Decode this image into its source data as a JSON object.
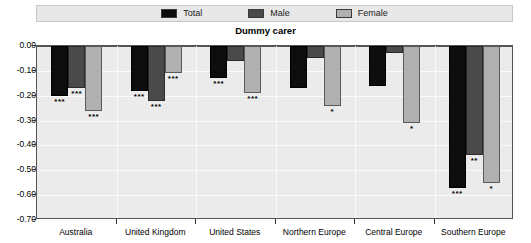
{
  "chart_data": {
    "type": "bar",
    "title": "Dummy carer",
    "subtitle": "",
    "xlabel": "",
    "ylabel": "",
    "ylim": [
      -0.7,
      0.0
    ],
    "ytick_labels": [
      "0.00",
      "-0.10",
      "-0.20",
      "-0.30",
      "-0.40",
      "-0.50",
      "-0.60",
      "-0.70"
    ],
    "ytick_values": [
      0.0,
      -0.1,
      -0.2,
      -0.3,
      -0.4,
      -0.5,
      -0.6,
      -0.7
    ],
    "grid": true,
    "legend_position": "top",
    "categories": [
      "Australia",
      "United Kingdom",
      "United States",
      "Northern Europe",
      "Central Europe",
      "Southern Europe"
    ],
    "series": [
      {
        "name": "Total",
        "color": "#0d0d0d",
        "values": [
          -0.2,
          -0.18,
          -0.13,
          -0.17,
          -0.16,
          -0.57
        ],
        "significance": [
          "***",
          "***",
          "***",
          "",
          "",
          "***"
        ]
      },
      {
        "name": "Male",
        "color": "#4a4a4a",
        "values": [
          -0.17,
          -0.22,
          -0.06,
          -0.05,
          -0.03,
          -0.44
        ],
        "significance": [
          "***",
          "***",
          "",
          "",
          "",
          "**"
        ]
      },
      {
        "name": "Female",
        "color": "#b0b0b0",
        "values": [
          -0.26,
          -0.11,
          -0.19,
          -0.24,
          -0.31,
          -0.55
        ],
        "significance": [
          "***",
          "***",
          "***",
          "*",
          "*",
          "*"
        ]
      }
    ]
  },
  "legend": {
    "items": [
      {
        "label": "Total"
      },
      {
        "label": "Male"
      },
      {
        "label": "Female"
      }
    ]
  }
}
